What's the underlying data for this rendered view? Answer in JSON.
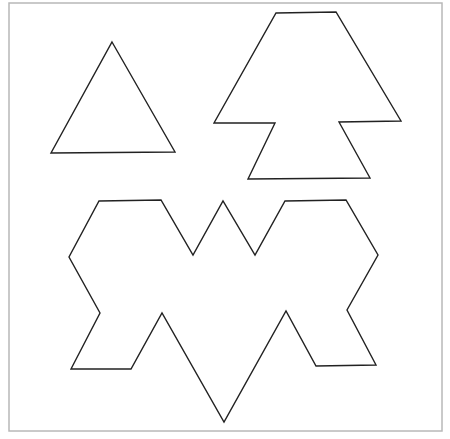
{
  "frame": {
    "x": 9,
    "y": 3,
    "width": 433,
    "height": 428,
    "stroke": "#b8b8b8"
  },
  "style": {
    "stroke": "#222222",
    "stroke_width": 1.4,
    "fill": "#ffffff"
  },
  "shapes": [
    {
      "name": "triangle",
      "points": "112,42 175,152 51,153"
    },
    {
      "name": "arrow-tree-shape",
      "points": "276,13 336,12 401,121 339,122 370,178 248,179 275,123 214,123"
    },
    {
      "name": "bat-shape",
      "points": "99,201 161,200 193,255 223,201 255,255 285,201 346,200 378,255 347,310 376,365 316,366 286,311 224,422 162,313 131,369 71,369 100,313 69,257"
    }
  ]
}
